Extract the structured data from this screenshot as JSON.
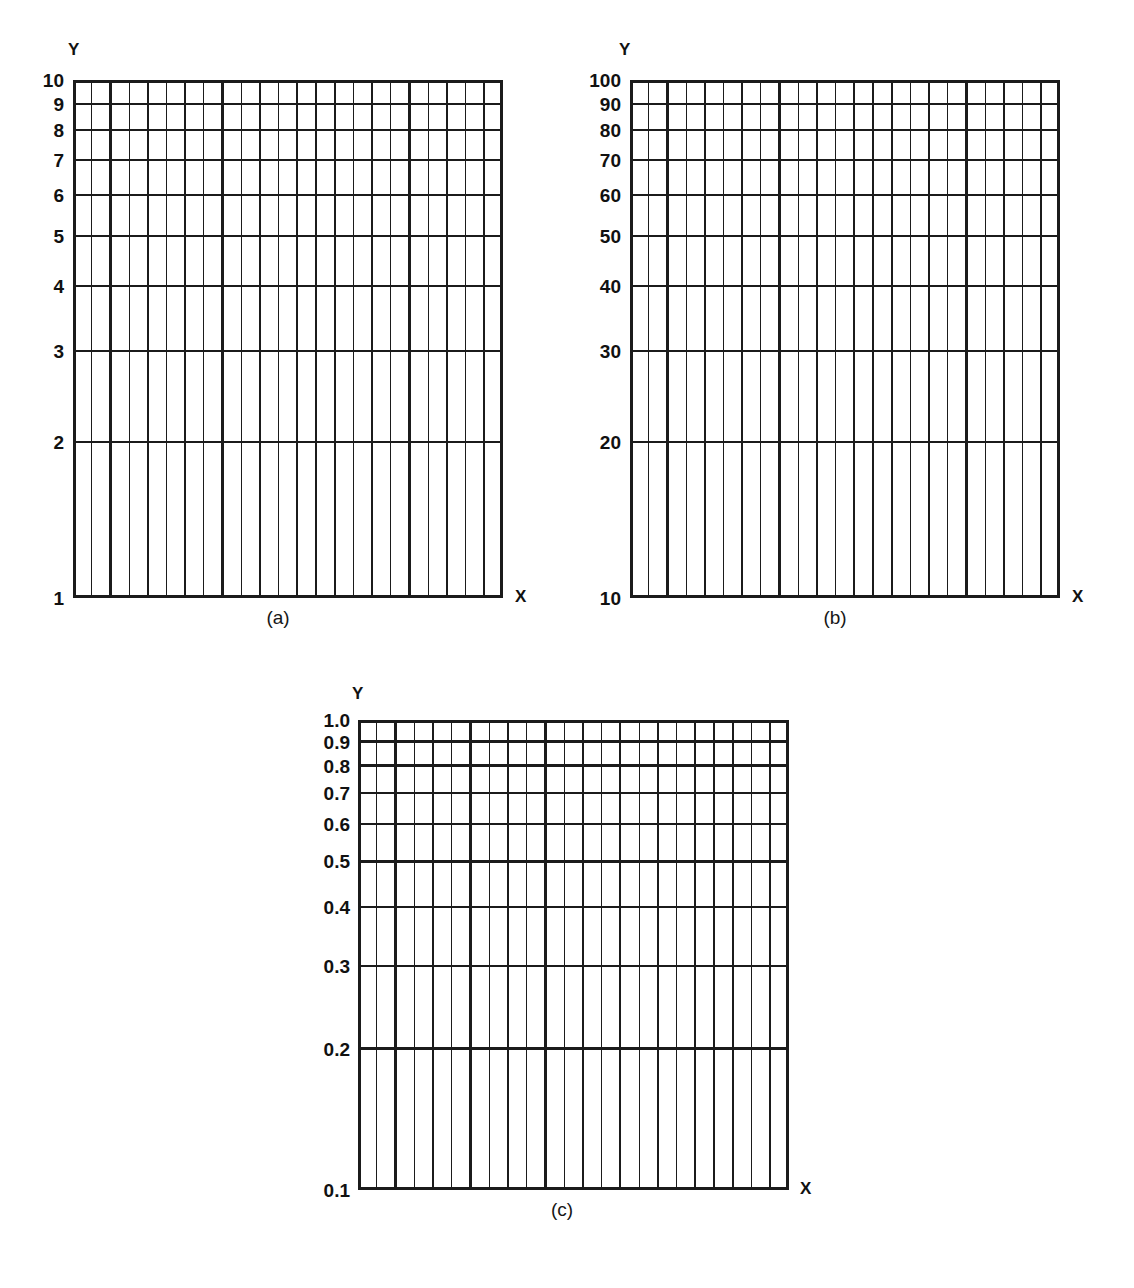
{
  "figure": {
    "kind": "semi-logarithmic graph paper",
    "background": "#ffffff",
    "ink_color": "#1a1a1a"
  },
  "panels": [
    {
      "id": "a",
      "caption": "(a)",
      "y_axis_title": "Y",
      "x_axis_title": "X",
      "y_scale": "log",
      "x_scale": "linear",
      "y_min": 1,
      "y_max": 10,
      "y_ticks": [
        "10",
        "9",
        "8",
        "7",
        "6",
        "5",
        "4",
        "3",
        "2",
        "1"
      ],
      "y_tick_values": [
        10,
        9,
        8,
        7,
        6,
        5,
        4,
        3,
        2,
        1
      ],
      "x_divisions": 23,
      "x_major_every": 2
    },
    {
      "id": "b",
      "caption": "(b)",
      "y_axis_title": "Y",
      "x_axis_title": "X",
      "y_scale": "log",
      "x_scale": "linear",
      "y_min": 10,
      "y_max": 100,
      "y_ticks": [
        "100",
        "90",
        "80",
        "70",
        "60",
        "50",
        "40",
        "30",
        "20",
        "10"
      ],
      "y_tick_values": [
        100,
        90,
        80,
        70,
        60,
        50,
        40,
        30,
        20,
        10
      ],
      "x_divisions": 23,
      "x_major_every": 2
    },
    {
      "id": "c",
      "caption": "(c)",
      "y_axis_title": "Y",
      "x_axis_title": "X",
      "y_scale": "log",
      "x_scale": "linear",
      "y_min": 0.1,
      "y_max": 1.0,
      "y_ticks": [
        "1.0",
        "0.9",
        "0.8",
        "0.7",
        "0.6",
        "0.5",
        "0.4",
        "0.3",
        "0.2",
        "0.1"
      ],
      "y_tick_values": [
        1.0,
        0.9,
        0.8,
        0.7,
        0.6,
        0.5,
        0.4,
        0.3,
        0.2,
        0.1
      ],
      "x_divisions": 23,
      "x_major_every": 2
    }
  ],
  "chart_data": {
    "type": "line",
    "title": "",
    "subtitle": "",
    "xlabel": "X",
    "ylabel": "Y",
    "grid": true,
    "legend": null,
    "series": [],
    "note": "Three blank semi-log grids; one decade of logarithmic Y per panel, linear X.",
    "charts": [
      {
        "panel": "(a)",
        "type": "line",
        "series": [],
        "xlabel": "X",
        "ylabel": "Y",
        "yscale": "log",
        "ylim": [
          1,
          10
        ],
        "ytick_labels": [
          "10",
          "9",
          "8",
          "7",
          "6",
          "5",
          "4",
          "3",
          "2",
          "1"
        ],
        "xscale": "linear",
        "x_divisions": 23,
        "grid": true
      },
      {
        "panel": "(b)",
        "type": "line",
        "series": [],
        "xlabel": "X",
        "ylabel": "Y",
        "yscale": "log",
        "ylim": [
          10,
          100
        ],
        "ytick_labels": [
          "100",
          "90",
          "80",
          "70",
          "60",
          "50",
          "40",
          "30",
          "20",
          "10"
        ],
        "xscale": "linear",
        "x_divisions": 23,
        "grid": true
      },
      {
        "panel": "(c)",
        "type": "line",
        "series": [],
        "xlabel": "X",
        "ylabel": "Y",
        "yscale": "log",
        "ylim": [
          0.1,
          1.0
        ],
        "ytick_labels": [
          "1.0",
          "0.9",
          "0.8",
          "0.7",
          "0.6",
          "0.5",
          "0.4",
          "0.3",
          "0.2",
          "0.1"
        ],
        "xscale": "linear",
        "x_divisions": 23,
        "grid": true
      }
    ]
  },
  "bleed_through": [
    {
      "text": "",
      "left": 300,
      "top": 4
    },
    {
      "text": "",
      "left": 700,
      "top": 8
    }
  ]
}
